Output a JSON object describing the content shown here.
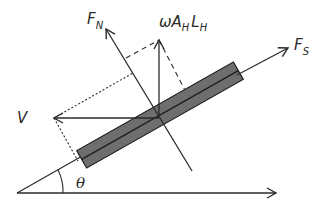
{
  "figure": {
    "type": "free-body force diagram"
  },
  "labels": {
    "normal_force": {
      "main": "F",
      "sub": "N"
    },
    "shear_force": {
      "main": "F",
      "sub": "S"
    },
    "vertical_force": {
      "omega": "ω",
      "a": "A",
      "a_sub": "H",
      "l": "L",
      "l_sub": "H"
    },
    "velocity": "V",
    "angle": "θ"
  },
  "colors": {
    "line": "#2a2a2a",
    "rod_fill": "#6e6e6e",
    "rod_stroke": "#1e1e1e",
    "background": "#ffffff"
  }
}
